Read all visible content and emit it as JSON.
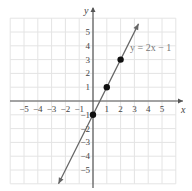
{
  "chart_data": {
    "type": "line",
    "title": "",
    "xlabel": "x",
    "ylabel": "y",
    "xlim": [
      -6,
      6
    ],
    "ylim": [
      -6,
      6
    ],
    "grid": true,
    "x_ticks": [
      -5,
      -4,
      -3,
      -2,
      -1,
      1,
      2,
      3,
      4,
      5
    ],
    "y_ticks": [
      -5,
      -4,
      -3,
      -2,
      -1,
      1,
      2,
      3,
      4,
      5
    ],
    "x_tick_labels": [
      "−5",
      "−4",
      "−3",
      "−2",
      "−1",
      "1",
      "2",
      "3",
      "4",
      "5"
    ],
    "y_tick_labels": [
      "−5",
      "−4",
      "−3",
      "−2",
      "−1",
      "1",
      "2",
      "3",
      "4",
      "5"
    ],
    "series": [
      {
        "name": "y = 2x − 1",
        "slope": 2,
        "intercept": -1,
        "line_from": [
          -2.5,
          -6
        ],
        "line_to": [
          3.3,
          5.6
        ],
        "arrows": "both",
        "color": "#666666"
      }
    ],
    "points": [
      {
        "x": 0,
        "y": -1
      },
      {
        "x": 1,
        "y": 1
      },
      {
        "x": 2,
        "y": 3
      }
    ],
    "annotation": {
      "text": "y = 2x − 1",
      "x": 2.4,
      "y": 4.0
    }
  },
  "labels": {
    "x_axis": "x",
    "y_axis": "y",
    "equation": "y = 2x − 1"
  }
}
